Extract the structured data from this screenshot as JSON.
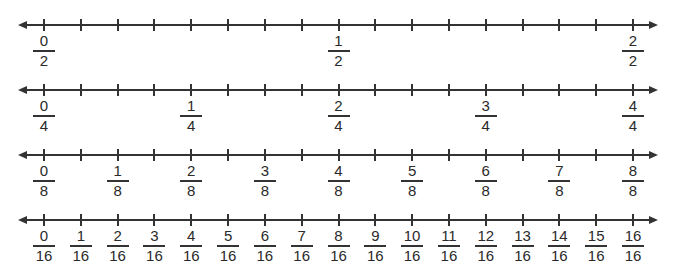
{
  "diagram": {
    "title": "",
    "number_lines": [
      {
        "denominator": 2,
        "labels": [
          {
            "num": "0",
            "den": "2",
            "tick": 0
          },
          {
            "num": "1",
            "den": "2",
            "tick": 8
          },
          {
            "num": "2",
            "den": "2",
            "tick": 16
          }
        ]
      },
      {
        "denominator": 4,
        "labels": [
          {
            "num": "0",
            "den": "4",
            "tick": 0
          },
          {
            "num": "1",
            "den": "4",
            "tick": 4
          },
          {
            "num": "2",
            "den": "4",
            "tick": 8
          },
          {
            "num": "3",
            "den": "4",
            "tick": 12
          },
          {
            "num": "4",
            "den": "4",
            "tick": 16
          }
        ]
      },
      {
        "denominator": 8,
        "labels": [
          {
            "num": "0",
            "den": "8",
            "tick": 0
          },
          {
            "num": "1",
            "den": "8",
            "tick": 2
          },
          {
            "num": "2",
            "den": "8",
            "tick": 4
          },
          {
            "num": "3",
            "den": "8",
            "tick": 6
          },
          {
            "num": "4",
            "den": "8",
            "tick": 8
          },
          {
            "num": "5",
            "den": "8",
            "tick": 10
          },
          {
            "num": "6",
            "den": "8",
            "tick": 12
          },
          {
            "num": "7",
            "den": "8",
            "tick": 14
          },
          {
            "num": "8",
            "den": "8",
            "tick": 16
          }
        ]
      },
      {
        "denominator": 16,
        "labels": [
          {
            "num": "0",
            "den": "16",
            "tick": 0
          },
          {
            "num": "1",
            "den": "16",
            "tick": 1
          },
          {
            "num": "2",
            "den": "16",
            "tick": 2
          },
          {
            "num": "3",
            "den": "16",
            "tick": 3
          },
          {
            "num": "4",
            "den": "16",
            "tick": 4
          },
          {
            "num": "5",
            "den": "16",
            "tick": 5
          },
          {
            "num": "6",
            "den": "16",
            "tick": 6
          },
          {
            "num": "7",
            "den": "16",
            "tick": 7
          },
          {
            "num": "8",
            "den": "16",
            "tick": 8
          },
          {
            "num": "9",
            "den": "16",
            "tick": 9
          },
          {
            "num": "10",
            "den": "16",
            "tick": 10
          },
          {
            "num": "11",
            "den": "16",
            "tick": 11
          },
          {
            "num": "12",
            "den": "16",
            "tick": 12
          },
          {
            "num": "13",
            "den": "16",
            "tick": 13
          },
          {
            "num": "14",
            "den": "16",
            "tick": 14
          },
          {
            "num": "15",
            "den": "16",
            "tick": 15
          },
          {
            "num": "16",
            "den": "16",
            "tick": 16
          }
        ]
      }
    ],
    "ticks_per_line": 17,
    "line_color": "#333333"
  }
}
